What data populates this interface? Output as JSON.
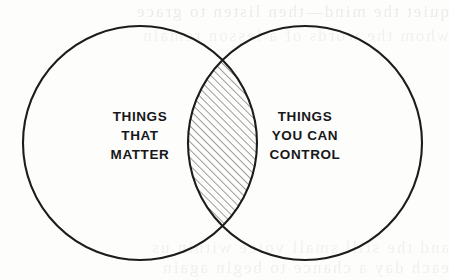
{
  "diagram": {
    "type": "venn-2-circle",
    "title": "",
    "background_color": "#fdfdfc",
    "stroke_color": "#1c1c1c",
    "text_color": "#17171a",
    "hatch_color": "#8d8d8d",
    "left_circle": {
      "name": "things-that-matter",
      "cx": 140,
      "cy": 143,
      "r": 117,
      "label_lines": [
        "THINGS",
        "THAT",
        "MATTER"
      ]
    },
    "right_circle": {
      "name": "things-you-can-control",
      "cx": 305,
      "cy": 143,
      "r": 117,
      "label_lines": [
        "THINGS",
        "YOU CAN",
        "CONTROL"
      ]
    },
    "intersection": {
      "name": "overlap-lens",
      "fill": "diagonal-hatch",
      "hatch_angle_deg": 45,
      "hatch_spacing_px": 4,
      "label_lines": []
    },
    "ghost_text": {
      "top_line_1": "quiet the mind—then listen to grace",
      "top_line_2": "whom the words of a lesson remain",
      "bottom_line_1": "and the still small voice within us",
      "bottom_line_2": "each day a chance to begin again"
    }
  }
}
